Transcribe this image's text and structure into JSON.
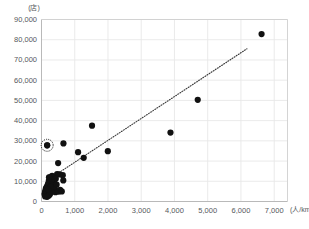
{
  "chart_data": {
    "type": "scatter",
    "title": "",
    "xlabel": "",
    "ylabel": "",
    "x_unit": "(人/km²)",
    "y_unit": "(店)",
    "xlim": [
      0,
      7400
    ],
    "ylim": [
      0,
      90000
    ],
    "grid": true,
    "legend": false,
    "x_ticks": [
      0,
      1000,
      2000,
      3000,
      4000,
      5000,
      6000,
      7000
    ],
    "x_tick_labels": [
      "0",
      "1,000",
      "2,000",
      "3,000",
      "4,000",
      "5,000",
      "6,000",
      "7,000"
    ],
    "y_ticks": [
      0,
      10000,
      20000,
      30000,
      40000,
      50000,
      60000,
      70000,
      80000,
      90000
    ],
    "y_tick_labels": [
      "0",
      "10,000",
      "20,000",
      "30,000",
      "40,000",
      "50,000",
      "60,000",
      "70,000",
      "80,000",
      "90,000"
    ],
    "marker_color": "#111111",
    "marker_size": 3.1,
    "gridline_color": "#e8e8e8",
    "axis_color": "#cfcfcf",
    "trendline": {
      "style": "dotted",
      "color": "#3a3a3a",
      "x_start": 270,
      "y_start": 11500,
      "x_end": 6180,
      "y_end": 75500
    },
    "highlight": {
      "x": 170,
      "y": 27800,
      "annotation": "circled-point",
      "ring_radius": 6.0,
      "ring_color": "#111111"
    },
    "points": [
      {
        "x": 6620,
        "y": 82800
      },
      {
        "x": 4700,
        "y": 50300
      },
      {
        "x": 3880,
        "y": 34100
      },
      {
        "x": 1995,
        "y": 24900
      },
      {
        "x": 1520,
        "y": 37500
      },
      {
        "x": 1270,
        "y": 21600
      },
      {
        "x": 1100,
        "y": 24400
      },
      {
        "x": 660,
        "y": 28700
      },
      {
        "x": 170,
        "y": 27800
      },
      {
        "x": 500,
        "y": 19000
      },
      {
        "x": 640,
        "y": 13000
      },
      {
        "x": 540,
        "y": 13400
      },
      {
        "x": 470,
        "y": 13600
      },
      {
        "x": 320,
        "y": 12700
      },
      {
        "x": 250,
        "y": 11900
      },
      {
        "x": 655,
        "y": 10400
      },
      {
        "x": 430,
        "y": 11200
      },
      {
        "x": 370,
        "y": 10000
      },
      {
        "x": 300,
        "y": 9600
      },
      {
        "x": 255,
        "y": 9100
      },
      {
        "x": 220,
        "y": 10200
      },
      {
        "x": 195,
        "y": 8700
      },
      {
        "x": 300,
        "y": 8000
      },
      {
        "x": 175,
        "y": 7800
      },
      {
        "x": 235,
        "y": 7300
      },
      {
        "x": 150,
        "y": 7000
      },
      {
        "x": 205,
        "y": 6600
      },
      {
        "x": 265,
        "y": 6200
      },
      {
        "x": 160,
        "y": 6000
      },
      {
        "x": 130,
        "y": 6400
      },
      {
        "x": 190,
        "y": 5600
      },
      {
        "x": 235,
        "y": 5300
      },
      {
        "x": 150,
        "y": 5000
      },
      {
        "x": 120,
        "y": 5400
      },
      {
        "x": 175,
        "y": 4700
      },
      {
        "x": 210,
        "y": 4400
      },
      {
        "x": 140,
        "y": 4300
      },
      {
        "x": 110,
        "y": 4800
      },
      {
        "x": 165,
        "y": 4000
      },
      {
        "x": 195,
        "y": 3800
      },
      {
        "x": 130,
        "y": 3600
      },
      {
        "x": 100,
        "y": 4100
      },
      {
        "x": 155,
        "y": 3300
      },
      {
        "x": 180,
        "y": 3100
      },
      {
        "x": 120,
        "y": 3000
      },
      {
        "x": 95,
        "y": 3400
      },
      {
        "x": 145,
        "y": 2700
      },
      {
        "x": 215,
        "y": 2900
      },
      {
        "x": 110,
        "y": 2500
      },
      {
        "x": 170,
        "y": 2300
      },
      {
        "x": 250,
        "y": 3500
      },
      {
        "x": 290,
        "y": 4500
      },
      {
        "x": 330,
        "y": 5200
      },
      {
        "x": 385,
        "y": 5800
      },
      {
        "x": 420,
        "y": 4600
      },
      {
        "x": 470,
        "y": 5100
      },
      {
        "x": 520,
        "y": 4900
      },
      {
        "x": 560,
        "y": 5700
      },
      {
        "x": 610,
        "y": 5000
      },
      {
        "x": 345,
        "y": 6900
      },
      {
        "x": 400,
        "y": 7500
      },
      {
        "x": 455,
        "y": 8300
      },
      {
        "x": 280,
        "y": 7200
      },
      {
        "x": 225,
        "y": 12000
      },
      {
        "x": 200,
        "y": 5900
      }
    ]
  }
}
